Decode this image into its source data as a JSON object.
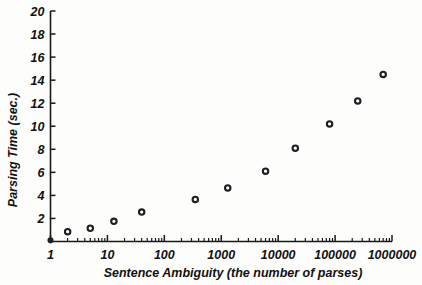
{
  "chart_data": {
    "type": "scatter",
    "title": "",
    "xlabel": "Sentence Ambiguity (the number of parses)",
    "ylabel": "Parsing Time (sec.)",
    "xscale": "log",
    "yscale": "linear",
    "xlim": [
      1,
      1000000
    ],
    "ylim": [
      0,
      20
    ],
    "grid": false,
    "legend": null,
    "xtick_labels": [
      "1",
      "10",
      "100",
      "1000",
      "10000",
      "100000",
      "1000000"
    ],
    "xtick_values": [
      1,
      10,
      100,
      1000,
      10000,
      100000,
      1000000
    ],
    "ytick_labels": [
      "2",
      "4",
      "6",
      "8",
      "10",
      "12",
      "14",
      "16",
      "18",
      "20"
    ],
    "ytick_values": [
      2,
      4,
      6,
      8,
      10,
      12,
      14,
      16,
      18,
      20
    ],
    "series": [
      {
        "name": "parsing time",
        "marker": "open-circle",
        "color": "#1f1f22",
        "points": [
          {
            "x": 1,
            "y": 0.1,
            "filled": true
          },
          {
            "x": 2,
            "y": 0.85,
            "filled": false
          },
          {
            "x": 5,
            "y": 1.15,
            "filled": false
          },
          {
            "x": 13,
            "y": 1.75,
            "filled": false
          },
          {
            "x": 40,
            "y": 2.55,
            "filled": false
          },
          {
            "x": 350,
            "y": 3.65,
            "filled": false
          },
          {
            "x": 1300,
            "y": 4.65,
            "filled": false
          },
          {
            "x": 6000,
            "y": 6.1,
            "filled": false
          },
          {
            "x": 20000,
            "y": 8.1,
            "filled": false
          },
          {
            "x": 80000,
            "y": 10.2,
            "filled": false
          },
          {
            "x": 250000,
            "y": 12.2,
            "filled": false
          },
          {
            "x": 700000,
            "y": 14.5,
            "filled": false
          },
          {
            "x": 3000000,
            "y": 18.6,
            "filled": false
          }
        ]
      }
    ]
  },
  "axes": {
    "y_title": "Parsing Time (sec.)",
    "x_title": "Sentence Ambiguity (the number of parses)"
  },
  "colors": {
    "ink": "#1f1f22",
    "background": "#fdfdfc"
  }
}
